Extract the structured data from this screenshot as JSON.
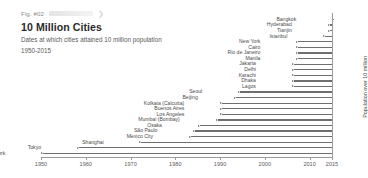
{
  "header": {
    "fig_number": "Fig. #02",
    "redacted_label": "",
    "chevron": "❯",
    "title": "10 Million Cities",
    "subtitle": "Dates at which cities attained 10 million population",
    "range": "1950-2015"
  },
  "axis": {
    "y_label": "Population over 10 million",
    "x_ticks": [
      "1950",
      "1960",
      "1970",
      "1980",
      "1990",
      "2000",
      "2010",
      "2015"
    ]
  },
  "chart_data": {
    "type": "bar",
    "orientation": "horizontal",
    "title": "10 Million Cities",
    "subtitle": "Dates at which cities attained 10 million population",
    "xlabel": "",
    "ylabel": "Population over 10 million",
    "xlim": [
      1947,
      2015
    ],
    "grid": false,
    "legend": false,
    "note": "Each bar spans from the year the city reached 10 million population to 2015.",
    "end_year": 2015,
    "categories": [
      "Bangkok",
      "Hyderabad",
      "Tianjin",
      "Istanbul",
      "New York",
      "Cairo",
      "Rio de Janeiro",
      "Manila",
      "Jakarta",
      "Delhi",
      "Karachi",
      "Dhaka",
      "Lagos",
      "Seoul",
      "Beijing",
      "Kolkata (Calcutta)",
      "Buenos Aires",
      "Los Angeles",
      "Mumbai (Bombay)",
      "Osaka",
      "São Paulo",
      "Mexico City",
      "Shanghai",
      "Tokyo",
      "New York"
    ],
    "values": [
      2015,
      2014,
      2014,
      2013,
      2007,
      2007,
      2007,
      2007,
      2006,
      2006,
      2006,
      2006,
      2006,
      1994,
      1993,
      1990,
      1990,
      1990,
      1989,
      1985,
      1984,
      1983,
      1972,
      1958,
      1950
    ],
    "bars": [
      {
        "label": "Bangkok",
        "start": 2015,
        "end": 2015
      },
      {
        "label": "Hyderabad",
        "start": 2014,
        "end": 2015
      },
      {
        "label": "Tianjin",
        "start": 2014,
        "end": 2015
      },
      {
        "label": "Istanbul",
        "start": 2013,
        "end": 2015
      },
      {
        "label": "New York",
        "start": 2007,
        "end": 2015
      },
      {
        "label": "Cairo",
        "start": 2007,
        "end": 2015
      },
      {
        "label": "Rio de Janeiro",
        "start": 2007,
        "end": 2015
      },
      {
        "label": "Manila",
        "start": 2007,
        "end": 2015
      },
      {
        "label": "Jakarta",
        "start": 2006,
        "end": 2015
      },
      {
        "label": "Delhi",
        "start": 2006,
        "end": 2015
      },
      {
        "label": "Karachi",
        "start": 2006,
        "end": 2015
      },
      {
        "label": "Dhaka",
        "start": 2006,
        "end": 2015
      },
      {
        "label": "Lagos",
        "start": 2006,
        "end": 2015
      },
      {
        "label": "Seoul",
        "start": 1994,
        "end": 2015
      },
      {
        "label": "Beijing",
        "start": 1993,
        "end": 2015
      },
      {
        "label": "Kolkata (Calcutta)",
        "start": 1990,
        "end": 2015
      },
      {
        "label": "Buenos Aires",
        "start": 1990,
        "end": 2015
      },
      {
        "label": "Los Angeles",
        "start": 1990,
        "end": 2015
      },
      {
        "label": "Mumbai (Bombay)",
        "start": 1989,
        "end": 2015
      },
      {
        "label": "Osaka",
        "start": 1985,
        "end": 2015
      },
      {
        "label": "São Paulo",
        "start": 1984,
        "end": 2015
      },
      {
        "label": "Mexico City",
        "start": 1983,
        "end": 2015
      },
      {
        "label": "Shanghai",
        "start": 1972,
        "end": 2015
      },
      {
        "label": "Tokyo",
        "start": 1958,
        "end": 2015
      },
      {
        "label": "New York",
        "start": 1950,
        "end": 2015
      }
    ]
  },
  "style": {
    "bar_color": "#6f6f6f",
    "axis_color": "#9a9a9a",
    "text_color": "#4a4a4a",
    "title_color": "#2b2b2b",
    "background": "#ffffff"
  }
}
